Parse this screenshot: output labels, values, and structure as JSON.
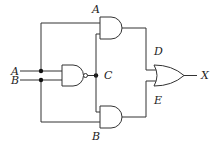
{
  "diagram": {
    "type": "logic-circuit",
    "labels": {
      "input_a": "A",
      "input_b": "B",
      "top_gate_label": "A",
      "bottom_gate_label": "B",
      "nand_output": "C",
      "top_and_output": "D",
      "bottom_and_output": "E",
      "output": "X"
    },
    "gates": [
      {
        "id": "nand1",
        "type": "NAND",
        "inputs": [
          "A",
          "B"
        ],
        "output": "C"
      },
      {
        "id": "and_top",
        "type": "AND",
        "inputs": [
          "A",
          "C"
        ],
        "output": "D"
      },
      {
        "id": "and_bottom",
        "type": "AND",
        "inputs": [
          "C",
          "B"
        ],
        "output": "E"
      },
      {
        "id": "or1",
        "type": "OR",
        "inputs": [
          "D",
          "E"
        ],
        "output": "X"
      }
    ]
  }
}
